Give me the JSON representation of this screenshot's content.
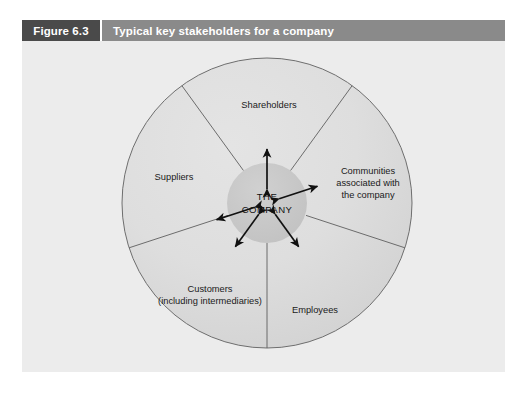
{
  "figure": {
    "number": "Figure 6.3",
    "title": "Typical key stakeholders for a company",
    "header_dark_color": "#4a4a4a",
    "header_light_color": "#8a8a8a",
    "body_background": "#ececec"
  },
  "diagram": {
    "center": {
      "line1": "THE",
      "line2": "COMPANY",
      "fill_color": "#c9c9c9"
    },
    "outer_circle": {
      "fill_color": "#dcdcdc",
      "stroke_color": "#6e6e6e"
    },
    "segments": [
      {
        "name": "shareholders",
        "lines": [
          "Shareholders"
        ],
        "label_x": 267,
        "label_y": 88,
        "arrow_angle_deg": -90
      },
      {
        "name": "suppliers",
        "lines": [
          "Suppliers"
        ],
        "label_x": 172,
        "label_y": 160,
        "arrow_angle_deg": -198
      },
      {
        "name": "communities",
        "lines": [
          "Communities",
          "associated with",
          "the company"
        ],
        "label_x": 366,
        "label_y": 154,
        "arrow_angle_deg": -18
      },
      {
        "name": "customers",
        "lines": [
          "Customers",
          "(including intermediaries)"
        ],
        "label_x": 208,
        "label_y": 272,
        "arrow_angle_deg": 234
      },
      {
        "name": "employees",
        "lines": [
          "Employees"
        ],
        "label_x": 313,
        "label_y": 293,
        "arrow_angle_deg": 306
      }
    ],
    "divider_angles_deg": [
      54,
      126,
      198,
      270,
      342
    ]
  }
}
